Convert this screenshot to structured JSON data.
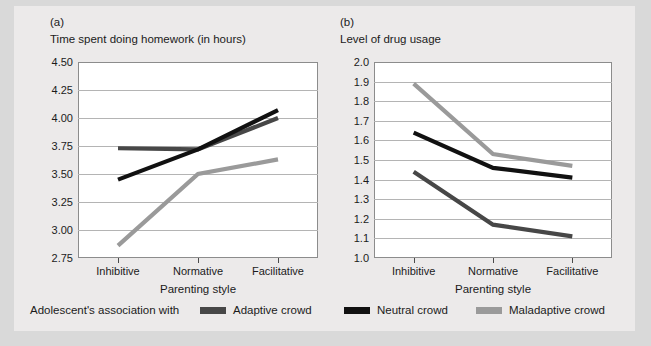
{
  "figure": {
    "legend_caption": "Adolescent's association with",
    "series_colors": {
      "adaptive": "#474747",
      "neutral": "#111111",
      "maladaptive": "#9a9a9a"
    },
    "legend_items": [
      {
        "label": "Adaptive crowd",
        "color": "#474747",
        "left": 186
      },
      {
        "label": "Neutral crowd",
        "color": "#111111",
        "left": 330
      },
      {
        "label": "Maladaptive crowd",
        "color": "#9a9a9a",
        "left": 462
      }
    ]
  },
  "chart_data": [
    {
      "panel": "(a)",
      "type": "line",
      "title": "Time spent doing homework (in hours)",
      "xlabel": "Parenting style",
      "ylabel": "",
      "categories": [
        "Inhibitive",
        "Normative",
        "Facilitative"
      ],
      "ylim": [
        2.75,
        4.5
      ],
      "yticks": [
        4.5,
        4.25,
        4.0,
        3.75,
        3.5,
        3.25,
        3.0,
        2.75
      ],
      "ytick_labels": [
        "4.50",
        "4.25",
        "4.00",
        "3.75",
        "3.50",
        "3.25",
        "3.00",
        "2.75"
      ],
      "grid": true,
      "legend_position": "below-figure",
      "series": [
        {
          "name": "Adaptive crowd",
          "key": "adaptive",
          "color": "#474747",
          "values": [
            3.73,
            3.72,
            4.0
          ]
        },
        {
          "name": "Neutral crowd",
          "key": "neutral",
          "color": "#111111",
          "values": [
            3.45,
            3.72,
            4.07
          ]
        },
        {
          "name": "Maladaptive crowd",
          "key": "maladaptive",
          "color": "#9a9a9a",
          "values": [
            2.86,
            3.5,
            3.63
          ]
        }
      ]
    },
    {
      "panel": "(b)",
      "type": "line",
      "title": "Level of drug usage",
      "xlabel": "Parenting style",
      "ylabel": "",
      "categories": [
        "Inhibitive",
        "Normative",
        "Facilitative"
      ],
      "ylim": [
        1.0,
        2.0
      ],
      "yticks": [
        2.0,
        1.9,
        1.8,
        1.7,
        1.6,
        1.5,
        1.4,
        1.3,
        1.2,
        1.1,
        1.0
      ],
      "ytick_labels": [
        "2.0",
        "1.9",
        "1.8",
        "1.7",
        "1.6",
        "1.5",
        "1.4",
        "1.3",
        "1.2",
        "1.1",
        "1.0"
      ],
      "grid": true,
      "legend_position": "below-figure",
      "series": [
        {
          "name": "Adaptive crowd",
          "key": "adaptive",
          "color": "#474747",
          "values": [
            1.44,
            1.17,
            1.11
          ]
        },
        {
          "name": "Neutral crowd",
          "key": "neutral",
          "color": "#111111",
          "values": [
            1.64,
            1.46,
            1.41
          ]
        },
        {
          "name": "Maladaptive crowd",
          "key": "maladaptive",
          "color": "#9a9a9a",
          "values": [
            1.89,
            1.53,
            1.47
          ]
        }
      ]
    }
  ]
}
